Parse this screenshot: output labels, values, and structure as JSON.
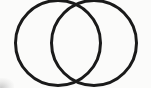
{
  "figure": {
    "name": "two-intersecting-circles",
    "caption": "",
    "canvas": {
      "width": 151,
      "height": 88,
      "background_color": "#fbfbfa"
    },
    "style": {
      "stroke_color": "#1a1a1a",
      "stroke_width": 3,
      "fill": "none",
      "line_cap": "round"
    },
    "shapes": [
      {
        "id": "left-circle",
        "label": "Left circle",
        "type": "circle",
        "cx": 58,
        "cy": 43,
        "r": 42.5
      },
      {
        "id": "right-circle",
        "label": "Right circle",
        "type": "circle",
        "cx": 94,
        "cy": 43,
        "r": 42.5
      }
    ],
    "intersections": [
      {
        "id": "top-intersection",
        "label": "Top crossing point",
        "x": 76,
        "y": 13
      },
      {
        "id": "bottom-intersection",
        "label": "Bottom crossing point",
        "x": 76,
        "y": 73
      }
    ],
    "artifacts": [
      {
        "id": "corner-smudge",
        "label": "Faint gray scan smudge, bottom-left corner",
        "color": "#8c8c8c"
      }
    ]
  }
}
